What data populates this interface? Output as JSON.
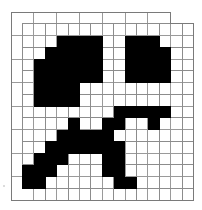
{
  "puzzle": {
    "type": "tessellation-pattern",
    "origin": [
      11,
      12
    ],
    "unit": [
      11.4,
      11.75
    ],
    "cols": 16,
    "rows": 16,
    "colors": {
      "fill": "#000000",
      "background": "#ffffff",
      "line": "#9a9a9a"
    },
    "black_cells": {
      "2": [
        4,
        5,
        6,
        7,
        10,
        11,
        12
      ],
      "3": [
        3,
        4,
        5,
        6,
        7,
        10,
        11,
        12,
        13
      ],
      "4": [
        2,
        3,
        4,
        5,
        6,
        7,
        10,
        11,
        12,
        13
      ],
      "5": [
        2,
        3,
        4,
        5,
        6,
        7,
        10,
        11,
        12,
        13
      ],
      "6": [
        2,
        3,
        4,
        5
      ],
      "7": [
        2,
        3,
        4,
        5
      ],
      "8": [
        9,
        10,
        11,
        12,
        13
      ],
      "9": [
        5,
        8,
        9,
        12
      ],
      "10": [
        4,
        5,
        6,
        7,
        8
      ],
      "11": [
        3,
        4,
        5,
        6,
        7,
        8,
        9
      ],
      "12": [
        2,
        3,
        4,
        8,
        9
      ],
      "13": [
        1,
        2,
        3,
        8,
        9
      ],
      "14": [
        1,
        2,
        9,
        10
      ]
    }
  }
}
